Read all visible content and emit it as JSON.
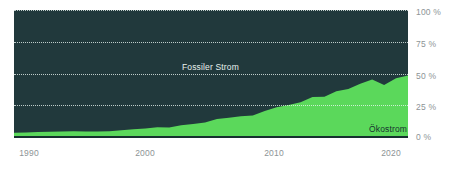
{
  "chart_data": {
    "type": "area",
    "title": "",
    "subtitle": "",
    "xlabel": "",
    "ylabel": "",
    "stacked": true,
    "percent_stacked": true,
    "grid": true,
    "legend_position": "inline-annotations",
    "xlim": [
      1990,
      2023
    ],
    "ylim": [
      0,
      100
    ],
    "x_ticks": [
      "1990",
      "2000",
      "2010",
      "2020"
    ],
    "x_tick_values": [
      1990,
      2000,
      2010,
      2020
    ],
    "y_ticks": [
      "0 %",
      "25 %",
      "50 %",
      "75 %",
      "100 %"
    ],
    "y_tick_values": [
      0,
      25,
      50,
      75,
      100
    ],
    "x": [
      1990,
      1991,
      1992,
      1993,
      1994,
      1995,
      1996,
      1997,
      1998,
      1999,
      2000,
      2001,
      2002,
      2003,
      2004,
      2005,
      2006,
      2007,
      2008,
      2009,
      2010,
      2011,
      2012,
      2013,
      2014,
      2015,
      2016,
      2017,
      2018,
      2019,
      2020,
      2021,
      2022,
      2023
    ],
    "series": [
      {
        "name": "Ökostrom",
        "color": "#5bd85b",
        "values": [
          3.4,
          3.6,
          4.0,
          4.1,
          4.4,
          4.6,
          4.4,
          4.3,
          4.6,
          5.3,
          6.2,
          6.6,
          7.6,
          7.5,
          9.2,
          10.2,
          11.5,
          14.2,
          15.1,
          16.3,
          17.0,
          20.4,
          23.5,
          25.1,
          27.4,
          31.5,
          31.6,
          36.0,
          37.8,
          42.0,
          45.2,
          41.0,
          46.2,
          48.5
        ]
      },
      {
        "name": "Fossiler Strom",
        "color": "#21393c",
        "values": [
          96.6,
          96.4,
          96.0,
          95.9,
          95.6,
          95.4,
          95.6,
          95.7,
          95.4,
          94.7,
          93.8,
          93.4,
          92.4,
          92.5,
          90.8,
          89.8,
          88.5,
          85.8,
          84.9,
          83.7,
          83.0,
          79.6,
          76.5,
          74.9,
          72.6,
          68.5,
          68.4,
          64.0,
          62.2,
          58.0,
          54.8,
          59.0,
          53.8,
          51.5
        ]
      }
    ],
    "annotations": [
      {
        "text": "Fossiler Strom",
        "series": "Fossiler Strom",
        "color": "#e8f1ee"
      },
      {
        "text": "Ökostrom",
        "series": "Ökostrom",
        "color": "#16302f"
      }
    ],
    "colors": {
      "background": "#ffffff",
      "plot_background": "#21393c",
      "eco": "#5bd85b",
      "fossil": "#21393c",
      "gridline": "#ecf6f2",
      "axis_line": "#16302f",
      "tick_label": "#8d9496"
    }
  }
}
